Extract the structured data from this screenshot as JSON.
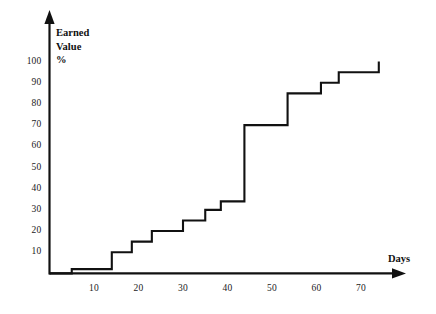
{
  "chart_data": {
    "type": "line",
    "line_style": "step-post",
    "title": "",
    "subtitle": "",
    "xlabel": "Days",
    "ylabel": "Earned Value %",
    "ylabel_lines": [
      "Earned",
      "Value",
      "%"
    ],
    "xlim": [
      0,
      78
    ],
    "ylim": [
      0,
      105
    ],
    "xticks": [
      10,
      20,
      30,
      40,
      50,
      60,
      70
    ],
    "yticks": [
      10,
      20,
      30,
      40,
      50,
      60,
      70,
      80,
      90,
      100
    ],
    "xtick_labels": [
      "10",
      "20",
      "30",
      "40",
      "50",
      "60",
      "70"
    ],
    "ytick_labels": [
      "10",
      "20",
      "30",
      "40",
      "50",
      "60",
      "70",
      "80",
      "90",
      "100"
    ],
    "grid": false,
    "legend": null,
    "axis_arrows": true,
    "series": [
      {
        "name": "Earned Value",
        "color": "#111111",
        "x": [
          0,
          5,
          5,
          14,
          14,
          18.5,
          18.5,
          23,
          23,
          30,
          30,
          35,
          35,
          38.5,
          38.5,
          43.8,
          43.8,
          53.5,
          53.5,
          61,
          61,
          65,
          65,
          74,
          74
        ],
        "y": [
          0,
          0,
          2,
          2,
          10,
          10,
          15,
          15,
          20,
          20,
          25,
          25,
          30,
          30,
          34,
          34,
          70,
          70,
          85,
          85,
          90,
          90,
          95,
          95,
          100
        ]
      }
    ],
    "steps": [
      {
        "day": 5,
        "value": 2
      },
      {
        "day": 14,
        "value": 10
      },
      {
        "day": 18.5,
        "value": 15
      },
      {
        "day": 23,
        "value": 20
      },
      {
        "day": 30,
        "value": 25
      },
      {
        "day": 35,
        "value": 30
      },
      {
        "day": 38.5,
        "value": 34
      },
      {
        "day": 43.8,
        "value": 70
      },
      {
        "day": 53.5,
        "value": 85
      },
      {
        "day": 61,
        "value": 90
      },
      {
        "day": 65,
        "value": 95
      },
      {
        "day": 74,
        "value": 100
      }
    ]
  },
  "colors": {
    "line": "#111111",
    "axis": "#111111",
    "background": "#ffffff",
    "text": "#111111"
  }
}
